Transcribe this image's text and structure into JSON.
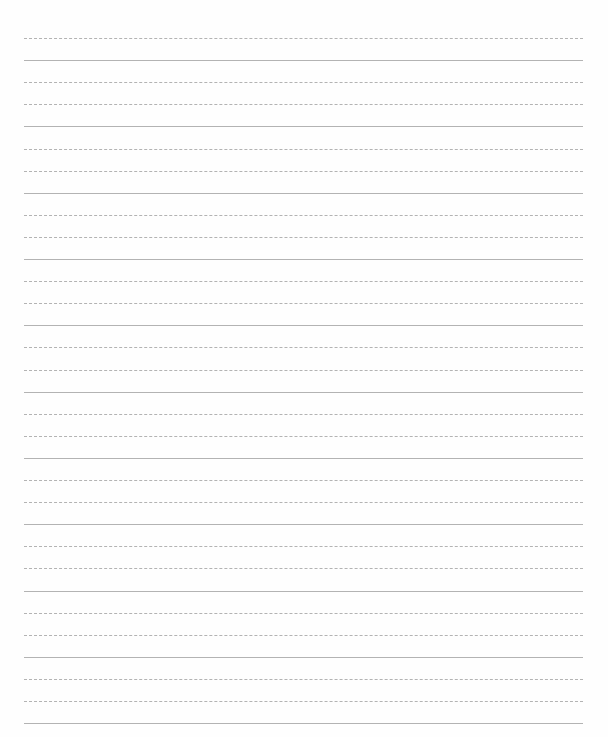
{
  "page": {
    "type": "blank lined paper",
    "background_color": "#ffffff",
    "line_color": "#9a9a9a",
    "line_count": 32,
    "first_line_y": 38,
    "line_spacing": 22.1,
    "line_left": 24,
    "line_right": 583
  }
}
